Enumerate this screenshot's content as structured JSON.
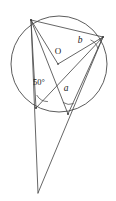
{
  "diagram": {
    "kind": "circle-geometry-diagram",
    "canvas": {
      "width": 116,
      "height": 201,
      "background": "#ffffff"
    },
    "style": {
      "line_color": "#4a4a4a",
      "label_color": "#1a1a1a",
      "circle_stroke_width": 0.9,
      "line_stroke_width": 0.85
    },
    "circle": {
      "name": "main-circle",
      "cx": 59,
      "cy": 64,
      "r": 48
    },
    "points": {
      "A": {
        "label": "",
        "x": 31,
        "y": 20,
        "desc": "top-left point on circle"
      },
      "B": {
        "label": "",
        "x": 103,
        "y": 37,
        "desc": "right point on circle"
      },
      "O": {
        "label": "O",
        "x": 58,
        "y": 64,
        "desc": "centre of circle"
      },
      "C": {
        "label": "",
        "x": 36,
        "y": 108,
        "desc": "lower-left point on circle"
      },
      "D": {
        "label": "",
        "x": 68,
        "y": 114,
        "desc": "lower-right point on circle"
      },
      "P": {
        "label": "",
        "x": 38,
        "y": 193,
        "desc": "external point below circle"
      }
    },
    "segments": [
      {
        "name": "segment-A-B",
        "from": "A",
        "to": "B"
      },
      {
        "name": "segment-A-O",
        "from": "A",
        "to": "O"
      },
      {
        "name": "segment-O-B",
        "from": "O",
        "to": "B"
      },
      {
        "name": "segment-A-C",
        "from": "A",
        "to": "C"
      },
      {
        "name": "segment-A-D",
        "from": "A",
        "to": "D"
      },
      {
        "name": "segment-C-B",
        "from": "C",
        "to": "B"
      },
      {
        "name": "segment-D-B",
        "from": "D",
        "to": "B"
      },
      {
        "name": "segment-A-P",
        "from": "A",
        "to": "P"
      },
      {
        "name": "segment-B-P",
        "from": "B",
        "to": "P"
      },
      {
        "name": "segment-C-P",
        "from": "C",
        "to": "P"
      }
    ],
    "labels": {
      "angle_b": {
        "text": "b",
        "x": 80,
        "y": 41,
        "font_size": 9.5,
        "italic": true
      },
      "centre_O": {
        "text": "O",
        "x": 58,
        "y": 52,
        "font_size": 9,
        "italic": false
      },
      "angle_50": {
        "text": "50°",
        "x": 33,
        "y": 83,
        "font_size": 8.5,
        "italic": false
      },
      "angle_a": {
        "text": "a",
        "x": 66,
        "y": 89,
        "font_size": 9.5,
        "italic": true
      }
    },
    "angle_arcs": [
      {
        "name": "arc-angle-b",
        "vertex": "B",
        "radius": 13
      },
      {
        "name": "arc-angle-50",
        "vertex": "C",
        "radius": 13
      },
      {
        "name": "arc-angle-a",
        "vertex": "D",
        "radius": 12
      }
    ]
  }
}
